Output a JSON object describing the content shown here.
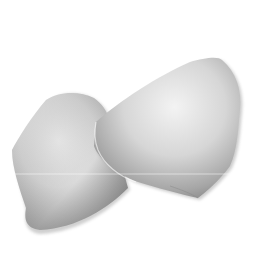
{
  "image": {
    "subject": "two white petals",
    "background_color": "#ffffff",
    "petal_light": "#f2f2f2",
    "petal_mid": "#c8c8c8",
    "petal_dark": "#8f8f8f"
  }
}
